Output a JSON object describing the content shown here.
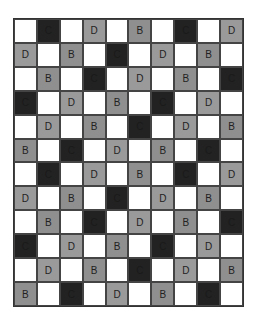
{
  "grid": {
    "rows": 12,
    "cols": 10,
    "colors": {
      "empty": "#ffffff",
      "B": "#8f8f8f",
      "C": "#222222",
      "D": "#9a9a9a",
      "border": "#444444"
    },
    "cells": [
      [
        "",
        "C",
        "",
        "D",
        "",
        "B",
        "",
        "C",
        "",
        "D"
      ],
      [
        "D",
        "",
        "B",
        "",
        "C",
        "",
        "D",
        "",
        "B",
        ""
      ],
      [
        "",
        "B",
        "",
        "C",
        "",
        "D",
        "",
        "B",
        "",
        "C"
      ],
      [
        "C",
        "",
        "D",
        "",
        "B",
        "",
        "C",
        "",
        "D",
        ""
      ],
      [
        "",
        "D",
        "",
        "B",
        "",
        "C",
        "",
        "D",
        "",
        "B"
      ],
      [
        "B",
        "",
        "C",
        "",
        "D",
        "",
        "B",
        "",
        "C",
        ""
      ],
      [
        "",
        "C",
        "",
        "D",
        "",
        "B",
        "",
        "C",
        "",
        "D"
      ],
      [
        "D",
        "",
        "B",
        "",
        "C",
        "",
        "D",
        "",
        "B",
        ""
      ],
      [
        "",
        "B",
        "",
        "C",
        "",
        "D",
        "",
        "B",
        "",
        "C"
      ],
      [
        "C",
        "",
        "D",
        "",
        "B",
        "",
        "C",
        "",
        "D",
        ""
      ],
      [
        "",
        "D",
        "",
        "B",
        "",
        "C",
        "",
        "D",
        "",
        "B"
      ],
      [
        "B",
        "",
        "C",
        "",
        "D",
        "",
        "B",
        "",
        "C",
        ""
      ]
    ]
  }
}
